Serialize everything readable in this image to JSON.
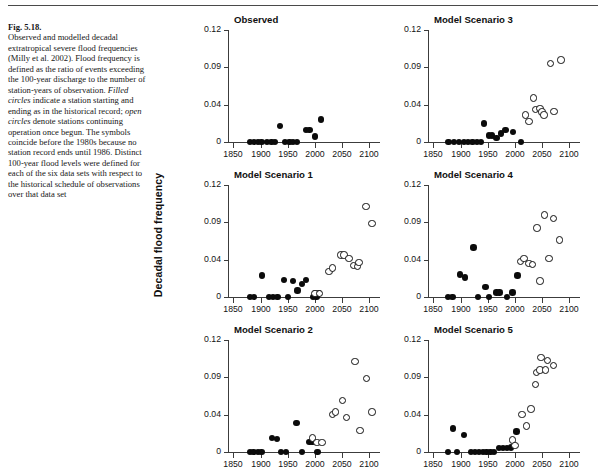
{
  "figure": {
    "label": "Fig. 5.18.",
    "caption": "Observed and modelled decadal extratropical severe flood frequencies (Milly et al. 2002). Flood frequency is defined as the ratio of events exceeding the 100-year discharge to the number of station-years of observation. Filled circles indicate a station starting and ending as in the historical record; open circles denote stations continuing operation once begun. The symbols coincide before the 1980s because no station record ends until 1986. Distinct 100-year flood levels were defined for each of the six data sets with respect to the historical schedule of observations over that data set",
    "caption_parts": {
      "p1": "Observed and modelled decadal extratropical severe flood frequencies (Milly et al. 2002). Flood frequency is defined as the ratio of events exceeding the 100-year discharge to the number of station-years of observation. ",
      "em1": "Filled circles",
      "p2": " indicate a station starting and ending as in the historical record; ",
      "em2": "open circles",
      "p3": " denote stations continuing operation once begun. The symbols coincide before the 1980s because no station record ends until 1986. Distinct 100-year flood levels were defined for each of the six data sets with respect to the historical schedule of observations over that data set"
    }
  },
  "axes": {
    "ylabel": "Decadal flood frequency",
    "ytick_labels": [
      "0.12",
      "0.09",
      "0.04",
      "0"
    ],
    "ytick_values": [
      0.12,
      0.09,
      0.04,
      0
    ],
    "xtick_labels": [
      "1850",
      "1900",
      "1950",
      "2000",
      "2050",
      "2100"
    ],
    "xtick_values": [
      1850,
      1900,
      1950,
      2000,
      2050,
      2100
    ],
    "xlim": [
      1840,
      2120
    ],
    "ylim": [
      0,
      0.12
    ],
    "grid": false,
    "legend": {
      "filled": "filled circles - station starting and ending as in the historical record",
      "open": "open circles - stations continuing operation once begun"
    }
  },
  "chart_data": {
    "type": "scatter",
    "title": "Observed and modelled decadal extratropical severe flood frequencies",
    "xlabel": "",
    "ylabel": "Decadal flood frequency",
    "xlim": [
      1840,
      2120
    ],
    "ylim": [
      0,
      0.12
    ],
    "grid": false,
    "legend_position": "none",
    "panels": [
      {
        "id": "observed",
        "title": "Observed",
        "row": 0,
        "col": 0,
        "series": [
          {
            "name": "filled",
            "marker": "filled-circle",
            "points": [
              [
                1880,
                0.0
              ],
              [
                1888,
                0.0
              ],
              [
                1895,
                0.0
              ],
              [
                1902,
                0.0
              ],
              [
                1912,
                0.0
              ],
              [
                1920,
                0.0
              ],
              [
                1927,
                0.0
              ],
              [
                1936,
                0.017
              ],
              [
                1945,
                0.0
              ],
              [
                1953,
                0.0
              ],
              [
                1960,
                0.0
              ],
              [
                1967,
                0.0
              ],
              [
                1984,
                0.013
              ],
              [
                1990,
                0.013
              ],
              [
                2000,
                0.006
              ],
              [
                2011,
                0.024
              ]
            ]
          },
          {
            "name": "open",
            "marker": "open-circle",
            "points": []
          }
        ]
      },
      {
        "id": "scenario3",
        "title": "Model Scenario 3",
        "row": 0,
        "col": 1,
        "series": [
          {
            "name": "filled",
            "marker": "filled-circle",
            "points": [
              [
                1878,
                0.0
              ],
              [
                1888,
                0.0
              ],
              [
                1897,
                0.0
              ],
              [
                1906,
                0.0
              ],
              [
                1914,
                0.0
              ],
              [
                1922,
                0.0
              ],
              [
                1930,
                0.0
              ],
              [
                1938,
                0.0
              ],
              [
                1943,
                0.02
              ],
              [
                1952,
                0.007
              ],
              [
                1958,
                0.007
              ],
              [
                1966,
                0.004
              ],
              [
                1974,
                0.009
              ],
              [
                1983,
                0.013
              ],
              [
                1997,
                0.011
              ],
              [
                2011,
                0.0
              ]
            ]
          },
          {
            "name": "open",
            "marker": "open-circle",
            "points": [
              [
                2020,
                0.029
              ],
              [
                2026,
                0.022
              ],
              [
                2034,
                0.047
              ],
              [
                2038,
                0.035
              ],
              [
                2046,
                0.036
              ],
              [
                2050,
                0.032
              ],
              [
                2054,
                0.029
              ],
              [
                2066,
                0.084
              ],
              [
                2072,
                0.033
              ],
              [
                2085,
                0.088
              ]
            ]
          }
        ]
      },
      {
        "id": "scenario1",
        "title": "Model Scenario 1",
        "row": 1,
        "col": 0,
        "series": [
          {
            "name": "filled",
            "marker": "filled-circle",
            "points": [
              [
                1880,
                0.0
              ],
              [
                1888,
                0.0
              ],
              [
                1903,
                0.023
              ],
              [
                1915,
                0.0
              ],
              [
                1923,
                0.0
              ],
              [
                1931,
                0.0
              ],
              [
                1943,
                0.018
              ],
              [
                1951,
                0.0
              ],
              [
                1960,
                0.017
              ],
              [
                1968,
                0.007
              ],
              [
                1976,
                0.014
              ],
              [
                1984,
                0.018
              ],
              [
                1997,
                0.0
              ],
              [
                2003,
                0.0
              ],
              [
                2000,
                0.004
              ],
              [
                2008,
                0.004
              ]
            ]
          },
          {
            "name": "open",
            "marker": "open-circle",
            "points": [
              [
                2000,
                0.004
              ],
              [
                2008,
                0.004
              ],
              [
                2026,
                0.027
              ],
              [
                2032,
                0.031
              ],
              [
                2048,
                0.045
              ],
              [
                2054,
                0.045
              ],
              [
                2063,
                0.041
              ],
              [
                2071,
                0.034
              ],
              [
                2078,
                0.033
              ],
              [
                2081,
                0.037
              ],
              [
                2094,
                0.097
              ],
              [
                2105,
                0.079
              ]
            ]
          }
        ]
      },
      {
        "id": "scenario4",
        "title": "Model Scenario 4",
        "row": 1,
        "col": 1,
        "series": [
          {
            "name": "filled",
            "marker": "filled-circle",
            "points": [
              [
                1877,
                0.0
              ],
              [
                1885,
                0.0
              ],
              [
                1899,
                0.024
              ],
              [
                1908,
                0.021
              ],
              [
                1924,
                0.053
              ],
              [
                1932,
                0.0
              ],
              [
                1946,
                0.011
              ],
              [
                1952,
                0.0
              ],
              [
                1966,
                0.005
              ],
              [
                1972,
                0.005
              ],
              [
                1985,
                0.0
              ],
              [
                1996,
                0.005
              ],
              [
                2005,
                0.023
              ]
            ]
          },
          {
            "name": "open",
            "marker": "open-circle",
            "points": [
              [
                2010,
                0.038
              ],
              [
                2017,
                0.041
              ],
              [
                2026,
                0.036
              ],
              [
                2033,
                0.035
              ],
              [
                2041,
                0.074
              ],
              [
                2046,
                0.017
              ],
              [
                2055,
                0.088
              ],
              [
                2063,
                0.041
              ],
              [
                2071,
                0.084
              ],
              [
                2082,
                0.061
              ]
            ]
          }
        ]
      },
      {
        "id": "scenario2",
        "title": "Model Scenario 2",
        "row": 2,
        "col": 0,
        "series": [
          {
            "name": "filled",
            "marker": "filled-circle",
            "points": [
              [
                1880,
                0.0
              ],
              [
                1887,
                0.0
              ],
              [
                1895,
                0.0
              ],
              [
                1902,
                0.0
              ],
              [
                1921,
                0.015
              ],
              [
                1930,
                0.014
              ],
              [
                1938,
                0.0
              ],
              [
                1947,
                0.0
              ],
              [
                1966,
                0.031
              ],
              [
                1976,
                0.0
              ],
              [
                1990,
                0.011
              ],
              [
                1996,
                0.011
              ],
              [
                2005,
                0.0
              ]
            ]
          },
          {
            "name": "open",
            "marker": "open-circle",
            "points": [
              [
                1996,
                0.015
              ],
              [
                2004,
                0.01
              ],
              [
                2013,
                0.01
              ],
              [
                2033,
                0.04
              ],
              [
                2038,
                0.043
              ],
              [
                2051,
                0.055
              ],
              [
                2058,
                0.037
              ],
              [
                2074,
                0.097
              ],
              [
                2083,
                0.023
              ],
              [
                2095,
                0.079
              ],
              [
                2105,
                0.043
              ]
            ]
          }
        ]
      },
      {
        "id": "scenario5",
        "title": "Model Scenario 5",
        "row": 2,
        "col": 1,
        "series": [
          {
            "name": "filled",
            "marker": "filled-circle",
            "points": [
              [
                1877,
                0.0
              ],
              [
                1886,
                0.025
              ],
              [
                1893,
                0.0
              ],
              [
                1906,
                0.018
              ],
              [
                1919,
                0.0
              ],
              [
                1927,
                0.0
              ],
              [
                1934,
                0.0
              ],
              [
                1941,
                0.0
              ],
              [
                1948,
                0.0
              ],
              [
                1955,
                0.0
              ],
              [
                1962,
                0.0
              ],
              [
                1971,
                0.004
              ],
              [
                1978,
                0.004
              ],
              [
                1985,
                0.004
              ],
              [
                1993,
                0.005
              ],
              [
                2003,
                0.022
              ]
            ]
          },
          {
            "name": "open",
            "marker": "open-circle",
            "points": [
              [
                1996,
                0.013
              ],
              [
                2000,
                0.007
              ],
              [
                2013,
                0.04
              ],
              [
                2022,
                0.028
              ],
              [
                2030,
                0.046
              ],
              [
                2040,
                0.085
              ],
              [
                2038,
                0.072
              ],
              [
                2048,
                0.101
              ],
              [
                2046,
                0.088
              ],
              [
                2060,
                0.098
              ],
              [
                2057,
                0.088
              ],
              [
                2071,
                0.093
              ]
            ]
          }
        ]
      }
    ]
  }
}
